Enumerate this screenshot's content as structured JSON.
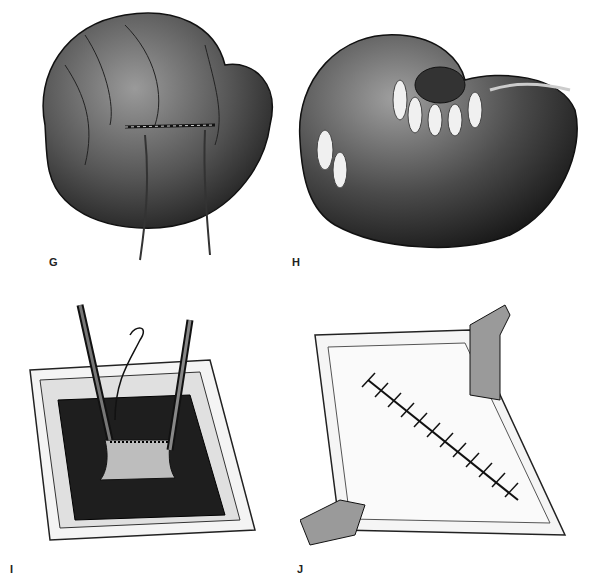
{
  "figure": {
    "panels": [
      {
        "label": "G",
        "subject": "stomach-with-sutures-and-drain-tubes"
      },
      {
        "label": "H",
        "subject": "stomach-with-omental-wrap"
      },
      {
        "label": "I",
        "subject": "wound-closure-with-forceps-and-needle"
      },
      {
        "label": "J",
        "subject": "closed-fascia-with-retractors-and-cross-stitches"
      }
    ]
  }
}
